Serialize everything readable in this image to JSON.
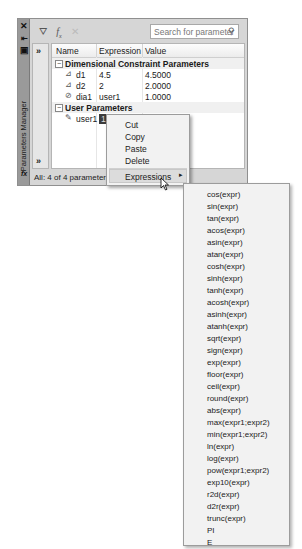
{
  "palette": {
    "title": "Parameters Manager",
    "strip_icons": [
      "close-icon",
      "auto-hide-icon",
      "properties-icon"
    ],
    "strip_fx": "fx",
    "toolbar": {
      "icons": [
        "new-parameter-icon",
        "new-user-parameter-icon",
        "delete-parameter-icon"
      ],
      "search_placeholder": "Search for parameter"
    },
    "expand_chevron": "»",
    "columns": [
      "Name",
      "Expression",
      "Value"
    ],
    "groups": [
      {
        "label": "Dimensional Constraint Parameters",
        "toggle": "−",
        "rows": [
          {
            "name": "d1",
            "expression": "4.5",
            "value": "4.5000"
          },
          {
            "name": "d2",
            "expression": "2",
            "value": "2.0000"
          },
          {
            "name": "dia1",
            "expression": "user1",
            "value": "1.0000"
          }
        ]
      },
      {
        "label": "User Parameters",
        "toggle": "−",
        "rows": [
          {
            "name": "user1",
            "expression": "1.0000",
            "value": "1.0000"
          }
        ]
      }
    ],
    "status": "All: 4 of 4 parameters displayed"
  },
  "context_menu": {
    "items": [
      "Cut",
      "Copy",
      "Paste",
      "Delete"
    ],
    "submenu_parent": "Expressions",
    "submenu_arrow": "▸"
  },
  "expressions_submenu": {
    "items": [
      "cos(expr)",
      "sin(expr)",
      "tan(expr)",
      "acos(expr)",
      "asin(expr)",
      "atan(expr)",
      "cosh(expr)",
      "sinh(expr)",
      "tanh(expr)",
      "acosh(expr)",
      "asinh(expr)",
      "atanh(expr)",
      "sqrt(expr)",
      "sign(expr)",
      "exp(expr)",
      "floor(expr)",
      "ceil(expr)",
      "round(expr)",
      "abs(expr)",
      "max(expr1;expr2)",
      "min(expr1;expr2)",
      "ln(expr)",
      "log(expr)",
      "pow(expr1;expr2)",
      "exp10(expr)",
      "r2d(expr)",
      "d2r(expr)",
      "trunc(expr)",
      "PI",
      "E"
    ]
  }
}
